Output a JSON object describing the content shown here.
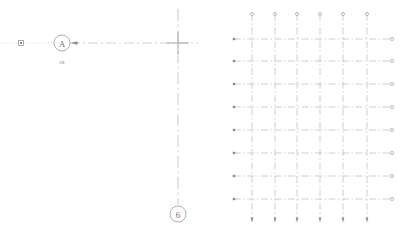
{
  "drawing": {
    "title": "CAD Grid Axis Layout",
    "background_color": "#ffffff",
    "line_color": "#b4b4b4",
    "grid_line_color": "#bdbdbd",
    "dark_line_color": "#8c8c8c",
    "text_color": "#6e6e6e",
    "width": 406,
    "height": 233
  },
  "left_panel": {
    "name": "axis-callout-panel",
    "grid_bubbles": [
      {
        "id": "bubble-a",
        "label": "A",
        "cx": 62,
        "cy": 43,
        "r": 8
      },
      {
        "id": "bubble-6",
        "label": "6",
        "cx": 178,
        "cy": 214,
        "r": 8
      }
    ],
    "dimension_labels": [
      {
        "id": "dim-2b",
        "text": "2B",
        "x": 62,
        "y": 63
      }
    ],
    "markers": [
      {
        "id": "square-node",
        "type": "square-marker",
        "x": 21,
        "y": 43,
        "size": 5
      },
      {
        "id": "arrow-head",
        "type": "arrow-left",
        "x": 76,
        "y": 43
      },
      {
        "id": "crosshair",
        "type": "crosshair",
        "x": 178,
        "y": 43,
        "arm": 11
      }
    ],
    "leader_lines": [
      {
        "id": "leader-dotted-left",
        "x1": 0,
        "y1": 43,
        "x2": 54,
        "y2": 43,
        "style": "dotted"
      },
      {
        "id": "leader-dashdot-right",
        "x1": 76,
        "y1": 43,
        "x2": 200,
        "y2": 43,
        "style": "dashdot"
      },
      {
        "id": "axis-vertical-6",
        "x1": 178,
        "y1": 10,
        "x2": 178,
        "y2": 206,
        "style": "dashdot"
      }
    ]
  },
  "right_panel": {
    "name": "structural-grid-panel",
    "grid": {
      "type": "dash-dot-grid",
      "column_count": 6,
      "row_count": 8,
      "columns_x": [
        252,
        275,
        297,
        320,
        343,
        367
      ],
      "rows_y": [
        39,
        61,
        84,
        107,
        130,
        153,
        176,
        199
      ],
      "column_top_y": 14,
      "column_bottom_y": 222,
      "row_left_x": 234,
      "row_right_x": 392,
      "column_end_marker": "circle-node",
      "row_end_marker": "circle-node"
    }
  }
}
